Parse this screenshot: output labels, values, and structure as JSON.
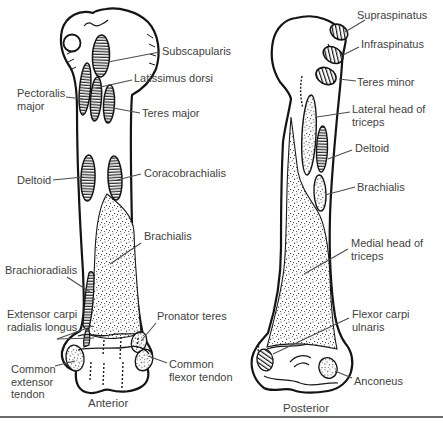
{
  "diagram_title": "Humerus muscle attachments",
  "views": [
    {
      "name": "Anterior",
      "labels": [
        {
          "id": "subscapularis",
          "text": "Subscapularis"
        },
        {
          "id": "latissimus-dorsi",
          "text": "Latissimus dorsi"
        },
        {
          "id": "pectoralis-major",
          "text": "Pectoralis major"
        },
        {
          "id": "teres-major",
          "text": "Teres major"
        },
        {
          "id": "deltoid",
          "text": "Deltoid"
        },
        {
          "id": "coracobrachialis",
          "text": "Coracobrachialis"
        },
        {
          "id": "brachialis",
          "text": "Brachialis"
        },
        {
          "id": "brachioradialis",
          "text": "Brachioradialis"
        },
        {
          "id": "extensor-carpi-radialis-longus",
          "text": "Extensor carpi radialis longus"
        },
        {
          "id": "pronator-teres",
          "text": "Pronator teres"
        },
        {
          "id": "common-extensor-tendon",
          "text": "Common extensor tendon"
        },
        {
          "id": "common-flexor-tendon",
          "text": "Common flexor tendon"
        }
      ]
    },
    {
      "name": "Posterior",
      "labels": [
        {
          "id": "supraspinatus",
          "text": "Supraspinatus"
        },
        {
          "id": "infraspinatus",
          "text": "Infraspinatus"
        },
        {
          "id": "teres-minor",
          "text": "Teres minor"
        },
        {
          "id": "lateral-head-of-triceps",
          "text": "Lateral head of triceps"
        },
        {
          "id": "deltoid",
          "text": "Deltoid"
        },
        {
          "id": "brachialis",
          "text": "Brachialis"
        },
        {
          "id": "medial-head-of-triceps",
          "text": "Medial head of triceps"
        },
        {
          "id": "flexor-carpi-ulnaris",
          "text": "Flexor carpi ulnaris"
        },
        {
          "id": "anconeus",
          "text": "Anconeus"
        }
      ]
    }
  ],
  "colors": {
    "background": "#ffffff",
    "bone_outline": "#141414",
    "leader_line": "#4d4d4d",
    "label_text": "#3f3f3f",
    "bottom_rule": "#3d3d3d"
  }
}
